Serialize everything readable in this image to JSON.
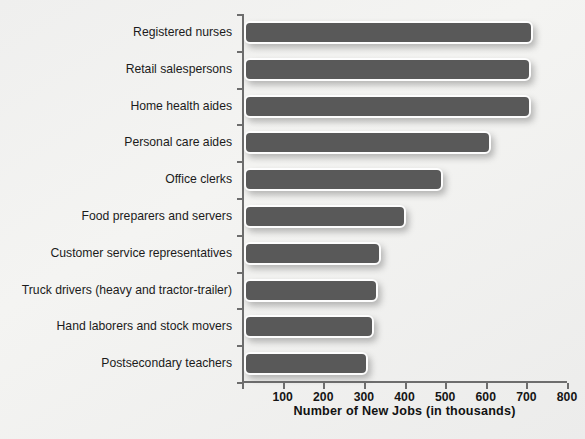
{
  "chart_data": {
    "type": "bar",
    "orientation": "horizontal",
    "title": "",
    "xlabel": "Number of New Jobs (in thousands)",
    "ylabel": "",
    "xlim": [
      0,
      800
    ],
    "xticks": [
      0,
      100,
      200,
      300,
      400,
      500,
      600,
      700,
      800
    ],
    "xtick_labels": [
      "",
      "100",
      "200",
      "300",
      "400",
      "500",
      "600",
      "700",
      "800"
    ],
    "grid": false,
    "legend": null,
    "bar_color": "#595959",
    "bar_edge_color": "#fdfdfd",
    "background_color": "#f1f1ef",
    "categories": [
      "Registered nurses",
      "Retail salespersons",
      "Home health aides",
      "Personal care aides",
      "Office clerks",
      "Food preparers and servers",
      "Customer service representatives",
      "Truck drivers (heavy and tractor-trailer)",
      "Hand laborers and stock movers",
      "Postsecondary teachers"
    ],
    "values": [
      712,
      706,
      706,
      607,
      489,
      398,
      338,
      330,
      319,
      305
    ]
  }
}
